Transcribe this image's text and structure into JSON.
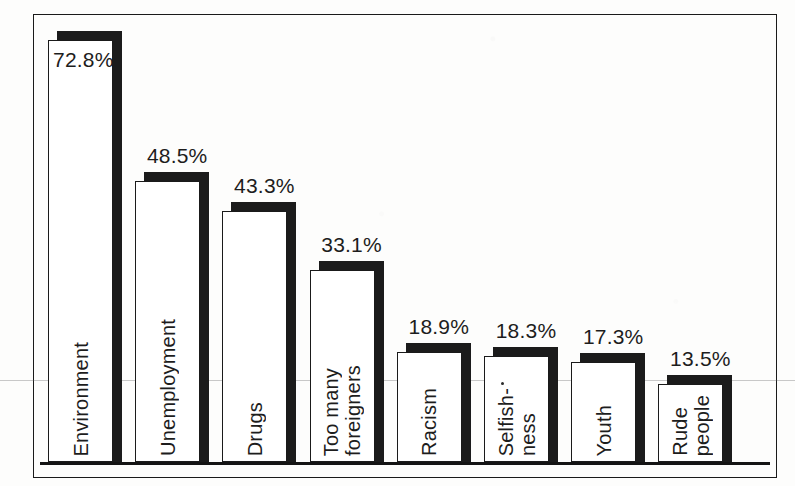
{
  "chart_data": {
    "type": "bar",
    "title": "",
    "subtitle": "",
    "xlabel": "",
    "ylabel": "",
    "ylim": [
      0,
      80
    ],
    "grid": false,
    "legend": null,
    "style": "3d-extruded-white-bars-black-shadow",
    "value_suffix": "%",
    "categories": [
      "Environment",
      "Unemployment",
      "Drugs",
      "Too many foreigners",
      "Racism",
      "Selfish-ness",
      "Youth",
      "Rude people"
    ],
    "values": [
      72.8,
      48.5,
      43.3,
      33.1,
      18.9,
      18.3,
      17.3,
      13.5
    ],
    "value_labels": [
      "72.8%",
      "48.5%",
      "43.3%",
      "33.1%",
      "18.9%",
      "18.3%",
      "17.3%",
      "13.5%"
    ],
    "category_label_lines": [
      [
        "Environment"
      ],
      [
        "Unemployment"
      ],
      [
        "Drugs"
      ],
      [
        "Too many",
        "foreigners"
      ],
      [
        "Racism"
      ],
      [
        "Selfish-",
        "ness"
      ],
      [
        "Youth"
      ],
      [
        "Rude",
        "people"
      ]
    ]
  },
  "colors": {
    "bar_face": "#ffffff",
    "bar_outline": "#1a1a1a",
    "bar_shadow": "#1b1b1b",
    "text": "#1d1d1d",
    "frame": "#1a1a1a",
    "background": "#fdfdfc"
  }
}
